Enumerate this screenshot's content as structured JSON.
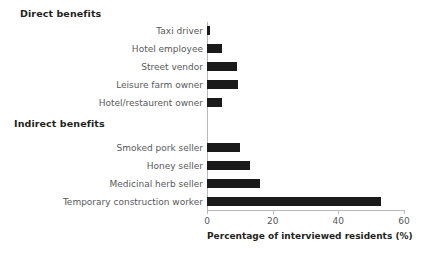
{
  "chart_data": {
    "type": "bar",
    "orientation": "horizontal",
    "title": "",
    "xlabel": "Percentage of interviewed residents (%)",
    "ylabel": "",
    "xlim": [
      0,
      60
    ],
    "xticks": [
      0,
      20,
      40,
      60
    ],
    "xtick_labels": [
      "0",
      "20",
      "40",
      "60"
    ],
    "grid": false,
    "legend": null,
    "bar_color": "#1a1a1a",
    "axis_color": "#b9b9b9",
    "label_color": "#58595b",
    "heading_color": "#231f20",
    "groups": [
      {
        "name": "Direct benefits",
        "label": "Direct benefits",
        "categories": [
          "Taxi driver",
          "Hotel employee",
          "Street vendor",
          "Leisure  farm owner",
          "Hotel/restaurent owner"
        ],
        "values": [
          1,
          4.5,
          9,
          9.5,
          4.5
        ]
      },
      {
        "name": "Indirect benefits",
        "label": "Indirect benefits",
        "categories": [
          "Smoked pork seller",
          "Honey seller",
          "Medicinal herb seller",
          "Temporary construction worker"
        ],
        "values": [
          10,
          13,
          16,
          53
        ]
      }
    ],
    "categories": [
      "Taxi driver",
      "Hotel employee",
      "Street vendor",
      "Leisure  farm owner",
      "Hotel/restaurent owner",
      "Smoked pork seller",
      "Honey seller",
      "Medicinal herb seller",
      "Temporary construction worker"
    ],
    "values": [
      1,
      4.5,
      9,
      9.5,
      4.5,
      10,
      13,
      16,
      53
    ]
  },
  "headings": {
    "direct": "Direct benefits",
    "indirect": "Indirect benefits"
  },
  "axis": {
    "x_title": "Percentage of interviewed residents (%)"
  }
}
